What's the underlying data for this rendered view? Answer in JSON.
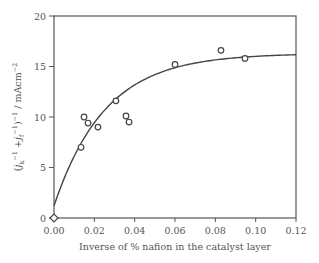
{
  "chart_data": {
    "type": "scatter",
    "title": "",
    "xlabel": "Inverse of % nafion in the catalyst layer",
    "ylabel": "(j_k^-1 + j_f^-1)^-1 / mAcm^-2",
    "ylabel_parts": {
      "open": "(",
      "j1": "j",
      "sub1": "k",
      "sup1": "−1",
      "plus": " +",
      "j2": "j",
      "sub2": "f",
      "sup2": "−1",
      "close": ")",
      "sup3": "−1",
      "unit": " / mAcm",
      "sup4": "−2"
    },
    "xlim": [
      0.0,
      0.12
    ],
    "ylim": [
      0,
      20
    ],
    "x_ticks": [
      "0.00",
      "0.02",
      "0.04",
      "0.06",
      "0.08",
      "0.10",
      "0.12"
    ],
    "y_ticks": [
      "0",
      "5",
      "10",
      "15",
      "20"
    ],
    "grid": false,
    "legend": null,
    "series": [
      {
        "name": "measured",
        "marker": "open-circle",
        "points": [
          {
            "x": 0.0134,
            "y": 7.0
          },
          {
            "x": 0.0149,
            "y": 10.0
          },
          {
            "x": 0.0169,
            "y": 9.4
          },
          {
            "x": 0.0218,
            "y": 9.0
          },
          {
            "x": 0.0307,
            "y": 11.6
          },
          {
            "x": 0.0357,
            "y": 10.1
          },
          {
            "x": 0.0372,
            "y": 9.5
          },
          {
            "x": 0.06,
            "y": 15.2
          },
          {
            "x": 0.0828,
            "y": 16.6
          },
          {
            "x": 0.0947,
            "y": 15.8
          }
        ]
      },
      {
        "name": "origin",
        "marker": "open-diamond",
        "points": [
          {
            "x": 0.0,
            "y": 0.0
          }
        ]
      },
      {
        "name": "fit",
        "type": "line",
        "model": "y = 1.2 + 15.1*(1 - exp(-x/0.0254))",
        "x": [
          0.0,
          0.01,
          0.02,
          0.03,
          0.04,
          0.06,
          0.08,
          0.1,
          0.12
        ],
        "values": [
          1.2,
          6.1,
          9.6,
          11.8,
          13.4,
          15.0,
          15.7,
          16.0,
          16.2
        ]
      }
    ]
  }
}
